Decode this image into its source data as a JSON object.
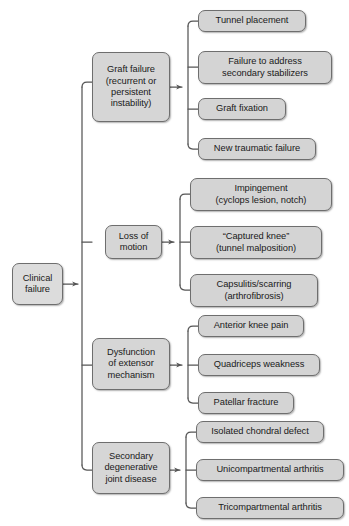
{
  "diagram": {
    "type": "hierarchical-tree",
    "orientation": "right-to-left",
    "colors": {
      "node_fill": "#d4d4d4",
      "node_border": "#6e6e6e",
      "connector": "#555555",
      "text": "#1a1a1a",
      "background": "#ffffff"
    },
    "root": {
      "label": "Clinical\nfailure"
    },
    "branches": [
      {
        "label": "Graft failure\n(recurrent or\npersistent\ninstability)",
        "children": [
          {
            "label": "Tunnel placement"
          },
          {
            "label": "Failure to address\nsecondary stabilizers"
          },
          {
            "label": "Graft fixation"
          },
          {
            "label": "New traumatic failure"
          }
        ]
      },
      {
        "label": "Loss of\nmotion",
        "children": [
          {
            "label": "Impingement\n(cyclops lesion, notch)"
          },
          {
            "label": "“Captured knee”\n(tunnel malposition)"
          },
          {
            "label": "Capsulitis/scarring\n(arthrofibrosis)"
          }
        ]
      },
      {
        "label": "Dysfunction\nof extensor\nmechanism",
        "children": [
          {
            "label": "Anterior knee pain"
          },
          {
            "label": "Quadriceps weakness"
          },
          {
            "label": "Patellar fracture"
          }
        ]
      },
      {
        "label": "Secondary\ndegenerative\njoint disease",
        "children": [
          {
            "label": "Isolated chondral defect"
          },
          {
            "label": "Unicompartmental arthritis"
          },
          {
            "label": "Tricompartmental arthritis"
          }
        ]
      }
    ]
  }
}
